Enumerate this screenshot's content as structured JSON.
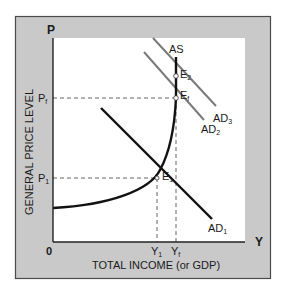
{
  "diagram": {
    "y_axis": {
      "symbol": "P",
      "label": "GENERAL PRICE LEVEL"
    },
    "x_axis": {
      "symbol": "Y",
      "label": "TOTAL INCOME (or GDP)",
      "origin": "0"
    },
    "price_ticks": [
      {
        "id": "pf",
        "base": "P",
        "sub": "f"
      },
      {
        "id": "p1",
        "base": "P",
        "sub": "1"
      }
    ],
    "income_ticks": [
      {
        "id": "y1",
        "base": "Y",
        "sub": "1"
      },
      {
        "id": "yf",
        "base": "Y",
        "sub": "f"
      }
    ],
    "curves": [
      {
        "id": "as",
        "label": "AS",
        "sub": ""
      },
      {
        "id": "ad1",
        "label": "AD",
        "sub": "1"
      },
      {
        "id": "ad2",
        "label": "AD",
        "sub": "2"
      },
      {
        "id": "ad3",
        "label": "AD",
        "sub": "3"
      }
    ],
    "equilibria": [
      {
        "id": "e1",
        "base": "E",
        "sub": "1"
      },
      {
        "id": "ef",
        "base": "E",
        "sub": "f"
      },
      {
        "id": "e2",
        "base": "E",
        "sub": "2"
      }
    ],
    "colors": {
      "frame": "#c9c9c9",
      "frame_border": "#4a4a4a",
      "plot_bg": "#ffffff",
      "curve_dark": "#111111",
      "curve_gray": "#7a7a7a",
      "dash": "#555555"
    }
  }
}
